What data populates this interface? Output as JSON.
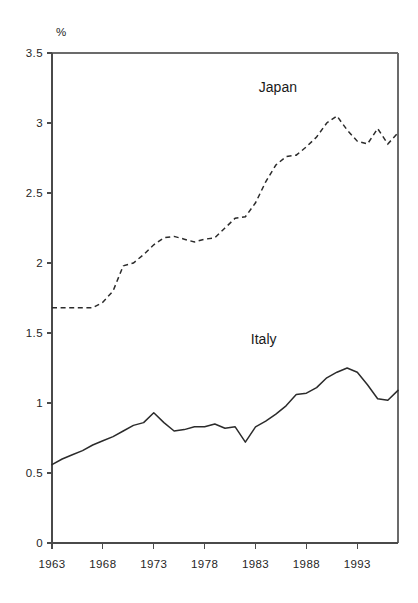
{
  "chart_data": {
    "type": "line",
    "title": "",
    "subtitle": "",
    "xlabel": "",
    "ylabel": "%",
    "unit_label": "%",
    "xlim": [
      1963,
      1997
    ],
    "ylim": [
      0,
      3.5
    ],
    "grid": false,
    "legend_position": "inline-annotation",
    "y_ticks": [
      "0",
      "0.5",
      "1",
      "1.5",
      "2",
      "2.5",
      "3",
      "3.5"
    ],
    "y_tick_values": [
      0,
      0.5,
      1,
      1.5,
      2,
      2.5,
      3,
      3.5
    ],
    "x_ticks": [
      "1963",
      "1968",
      "1973",
      "1978",
      "1983",
      "1988",
      "1993"
    ],
    "x_tick_values": [
      1963,
      1968,
      1973,
      1978,
      1983,
      1988,
      1993
    ],
    "x": [
      1963,
      1964,
      1965,
      1966,
      1967,
      1968,
      1969,
      1970,
      1971,
      1972,
      1973,
      1974,
      1975,
      1976,
      1977,
      1978,
      1979,
      1980,
      1981,
      1982,
      1983,
      1984,
      1985,
      1986,
      1987,
      1988,
      1989,
      1990,
      1991,
      1992,
      1993,
      1994,
      1995,
      1996,
      1997
    ],
    "series": [
      {
        "name": "Japan",
        "style": "dashed",
        "color": "#2b2b2b",
        "label_x": 1985.2,
        "label_y": 3.22,
        "values": [
          1.68,
          1.68,
          1.68,
          1.68,
          1.68,
          1.72,
          1.8,
          1.98,
          2.0,
          2.06,
          2.13,
          2.18,
          2.19,
          2.17,
          2.15,
          2.17,
          2.18,
          2.25,
          2.32,
          2.33,
          2.43,
          2.58,
          2.7,
          2.76,
          2.77,
          2.83,
          2.9,
          3.0,
          3.05,
          2.95,
          2.87,
          2.85,
          2.96,
          2.85,
          2.93
        ]
      },
      {
        "name": "Italy",
        "style": "solid",
        "color": "#2b2b2b",
        "label_x": 1983.8,
        "label_y": 1.42,
        "values": [
          0.56,
          0.6,
          0.63,
          0.66,
          0.7,
          0.73,
          0.76,
          0.8,
          0.84,
          0.86,
          0.93,
          0.86,
          0.8,
          0.81,
          0.83,
          0.83,
          0.85,
          0.82,
          0.83,
          0.72,
          0.83,
          0.87,
          0.92,
          0.98,
          1.06,
          1.07,
          1.11,
          1.18,
          1.22,
          1.25,
          1.22,
          1.13,
          1.03,
          1.02,
          1.09
        ]
      }
    ]
  },
  "layout": {
    "plot_left": 52,
    "plot_right": 398,
    "plot_top": 53,
    "plot_bottom": 543
  }
}
